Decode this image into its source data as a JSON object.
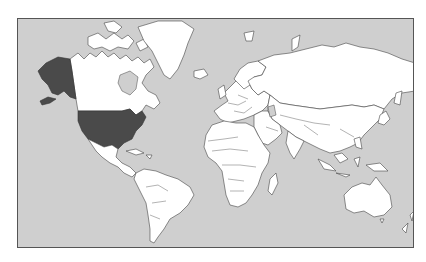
{
  "map": {
    "projection": "Mercator",
    "title": "",
    "labels": [],
    "colors": {
      "ocean": "#cfcfcf",
      "land": "#ffffff",
      "highlight": "#4a4a4a",
      "border": "#555555",
      "frame": "#555555",
      "background": "#ffffff"
    },
    "highlighted_regions": [
      {
        "name": "United States (contiguous)",
        "fill": "#4a4a4a"
      },
      {
        "name": "Alaska",
        "fill": "#4a4a4a"
      }
    ],
    "regions_shown": [
      "North America",
      "Greenland",
      "Central America",
      "Caribbean",
      "South America",
      "Europe",
      "Africa",
      "Middle East",
      "Russia",
      "Asia",
      "Southeast Asia",
      "Australia",
      "New Zealand",
      "Madagascar",
      "Iceland",
      "Japan"
    ]
  }
}
